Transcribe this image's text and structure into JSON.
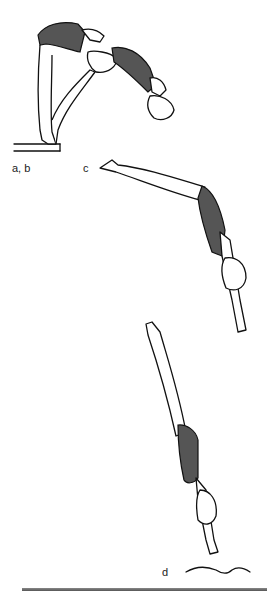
{
  "figure": {
    "stages": [
      {
        "id": "ab",
        "label": "a, b",
        "pose": "takeoff from board, piked forward lean"
      },
      {
        "id": "c",
        "label": "c",
        "pose": "layout in flight, arms extended downward"
      },
      {
        "id": "d",
        "label": "d",
        "pose": "vertical entry into water"
      }
    ],
    "elements": {
      "board": "springboard edge",
      "water": "water surface ripple"
    },
    "colors": {
      "ink": "#111111",
      "swimsuit": "#555555",
      "background": "#ffffff"
    }
  }
}
